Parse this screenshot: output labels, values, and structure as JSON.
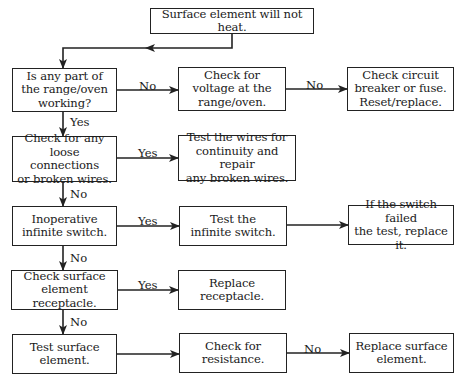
{
  "flowchart": {
    "title": "Surface element will not heat.",
    "nodes": [
      {
        "id": "start",
        "text": "Surface element will not heat.",
        "x": 150,
        "y": 8,
        "w": 164,
        "h": 26
      },
      {
        "id": "any_part_working",
        "text": "Is any part of\nthe range/oven\nworking?",
        "x": 12,
        "y": 68,
        "w": 105,
        "h": 44
      },
      {
        "id": "check_voltage",
        "text": "Check for\nvoltage at the\nrange/oven.",
        "x": 178,
        "y": 67,
        "w": 108,
        "h": 44
      },
      {
        "id": "check_breaker",
        "text": "Check circuit\nbreaker or fuse.\nReset/replace.",
        "x": 347,
        "y": 67,
        "w": 107,
        "h": 44
      },
      {
        "id": "loose_connections",
        "text": "Check for any\nloose connections\nor broken wires.",
        "x": 12,
        "y": 136,
        "w": 105,
        "h": 46
      },
      {
        "id": "test_wires",
        "text": "Test the wires for\ncontinuity and repair\nany broken wires.",
        "x": 178,
        "y": 135,
        "w": 118,
        "h": 46
      },
      {
        "id": "inoperative_switch",
        "text": "Inoperative\ninfinite switch.",
        "x": 12,
        "y": 206,
        "w": 105,
        "h": 40
      },
      {
        "id": "test_switch",
        "text": "Test the\ninfinite switch.",
        "x": 179,
        "y": 206,
        "w": 108,
        "h": 40
      },
      {
        "id": "replace_switch",
        "text": "If the switch failed\nthe test, replace it.",
        "x": 348,
        "y": 205,
        "w": 106,
        "h": 40
      },
      {
        "id": "check_receptacle",
        "text": "Check surface\nelement receptacle.",
        "x": 11,
        "y": 270,
        "w": 107,
        "h": 40
      },
      {
        "id": "replace_receptacle",
        "text": "Replace\nreceptacle.",
        "x": 178,
        "y": 270,
        "w": 108,
        "h": 40
      },
      {
        "id": "test_element",
        "text": "Test surface\nelement.",
        "x": 12,
        "y": 334,
        "w": 105,
        "h": 40
      },
      {
        "id": "check_resistance",
        "text": "Check for\nresistance.",
        "x": 179,
        "y": 333,
        "w": 108,
        "h": 40
      },
      {
        "id": "replace_element",
        "text": "Replace surface\nelement.",
        "x": 349,
        "y": 333,
        "w": 105,
        "h": 40
      }
    ],
    "edges": [
      {
        "from": "start",
        "to": "any_part_working",
        "label": "",
        "points": [
          [
            232,
            34
          ],
          [
            232,
            48
          ],
          [
            63,
            48
          ],
          [
            63,
            68
          ]
        ],
        "mid_arrow": [
          145,
          48,
          "left"
        ]
      },
      {
        "from": "any_part_working",
        "to": "check_voltage",
        "label": "No",
        "points": [
          [
            117,
            90
          ],
          [
            178,
            90
          ]
        ],
        "label_pos": [
          139,
          80
        ]
      },
      {
        "from": "check_voltage",
        "to": "check_breaker",
        "label": "No",
        "points": [
          [
            286,
            89
          ],
          [
            347,
            89
          ]
        ],
        "label_pos": [
          306,
          79
        ]
      },
      {
        "from": "any_part_working",
        "to": "loose_connections",
        "label": "Yes",
        "points": [
          [
            63,
            112
          ],
          [
            63,
            136
          ]
        ],
        "label_pos": [
          70,
          116
        ]
      },
      {
        "from": "loose_connections",
        "to": "test_wires",
        "label": "Yes",
        "points": [
          [
            117,
            158
          ],
          [
            178,
            158
          ]
        ],
        "label_pos": [
          138,
          147
        ]
      },
      {
        "from": "loose_connections",
        "to": "inoperative_switch",
        "label": "No",
        "points": [
          [
            63,
            182
          ],
          [
            63,
            206
          ]
        ],
        "label_pos": [
          70,
          188
        ]
      },
      {
        "from": "inoperative_switch",
        "to": "test_switch",
        "label": "Yes",
        "points": [
          [
            117,
            226
          ],
          [
            179,
            226
          ]
        ],
        "label_pos": [
          138,
          215
        ]
      },
      {
        "from": "test_switch",
        "to": "replace_switch",
        "label": "",
        "points": [
          [
            287,
            225
          ],
          [
            348,
            225
          ]
        ]
      },
      {
        "from": "inoperative_switch",
        "to": "check_receptacle",
        "label": "No",
        "points": [
          [
            63,
            246
          ],
          [
            63,
            270
          ]
        ],
        "label_pos": [
          70,
          252
        ]
      },
      {
        "from": "check_receptacle",
        "to": "replace_receptacle",
        "label": "Yes",
        "points": [
          [
            118,
            290
          ],
          [
            178,
            290
          ]
        ],
        "label_pos": [
          138,
          279
        ]
      },
      {
        "from": "check_receptacle",
        "to": "test_element",
        "label": "No",
        "points": [
          [
            63,
            310
          ],
          [
            63,
            334
          ]
        ],
        "label_pos": [
          70,
          316
        ]
      },
      {
        "from": "test_element",
        "to": "check_resistance",
        "label": "",
        "points": [
          [
            117,
            354
          ],
          [
            179,
            354
          ]
        ]
      },
      {
        "from": "check_resistance",
        "to": "replace_element",
        "label": "No",
        "points": [
          [
            287,
            353
          ],
          [
            349,
            353
          ]
        ],
        "label_pos": [
          304,
          343
        ]
      }
    ],
    "colors": {
      "line": "#222222",
      "box_border": "#222222",
      "background": "#ffffff",
      "text": "#1a1a1a"
    }
  }
}
